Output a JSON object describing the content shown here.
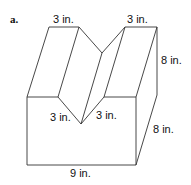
{
  "figure": {
    "part_label": "a.",
    "shape": "rectangular prism with V-shaped notch",
    "dimensions": {
      "top_left_segment": "3 in.",
      "top_right_segment": "3 in.",
      "notch_left_side": "3 in.",
      "notch_right_side": "3 in.",
      "height": "8 in.",
      "depth": "8 in.",
      "width": "9 in."
    },
    "colors": {
      "line": "#333333",
      "background": "#ffffff",
      "text": "#111111"
    }
  }
}
